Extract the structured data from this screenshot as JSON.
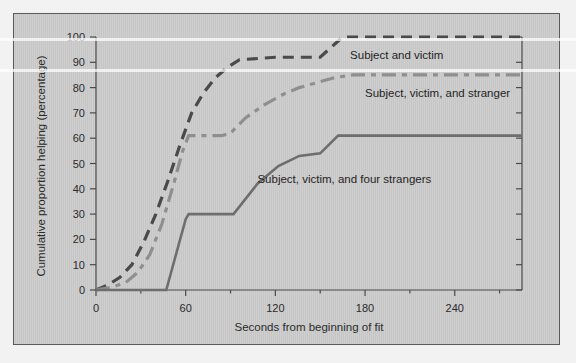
{
  "figure": {
    "background_color": "#f2f2f2",
    "panel_color": "#c9c9c9",
    "panel_border_color": "#5a5a5a"
  },
  "chart_data": {
    "type": "line",
    "title": "",
    "subtitle": "",
    "xlabel": "Seconds from beginning of fit",
    "ylabel": "Cumulative proportion helping (percentage)",
    "xlim": [
      0,
      285
    ],
    "ylim": [
      0,
      100
    ],
    "xticks": [
      0,
      60,
      120,
      180,
      240
    ],
    "xticklabels": [
      "0",
      "60",
      "120",
      "180",
      "240"
    ],
    "xminorticks": [
      30,
      90,
      150,
      210,
      270
    ],
    "yticks": [
      0,
      10,
      20,
      30,
      40,
      50,
      60,
      70,
      80,
      90,
      100
    ],
    "yticklabels": [
      "0",
      "10",
      "20",
      "30",
      "40",
      "50",
      "60",
      "70",
      "80",
      "90",
      "100"
    ],
    "grid": false,
    "legend_position": "inline-annotations",
    "series": [
      {
        "name": "Subject and victim",
        "color": "#4a4a4a",
        "dash": "long-dash",
        "linewidth": 3.2,
        "label_x": 170,
        "label_y": 93,
        "x": [
          0,
          8,
          16,
          24,
          32,
          40,
          48,
          56,
          64,
          72,
          80,
          88,
          96,
          120,
          150,
          165,
          180,
          210,
          240,
          270,
          285
        ],
        "y": [
          0,
          2,
          5,
          10,
          19,
          30,
          43,
          57,
          70,
          78,
          84,
          88,
          91,
          92,
          92,
          100,
          100,
          100,
          100,
          100,
          100
        ]
      },
      {
        "name": "Subject, victim, and stranger",
        "color": "#8f8f8f",
        "dash": "dash-dot",
        "linewidth": 3.2,
        "label_x": 180,
        "label_y": 78,
        "x": [
          0,
          10,
          20,
          28,
          36,
          44,
          52,
          58,
          62,
          72,
          84,
          90,
          100,
          112,
          124,
          136,
          148,
          160,
          172,
          180,
          210,
          240,
          270,
          285
        ],
        "y": [
          0,
          1,
          3,
          7,
          14,
          26,
          42,
          55,
          61,
          61,
          61,
          62,
          68,
          73,
          77,
          80,
          82,
          84,
          85,
          85,
          85,
          85,
          85,
          85
        ]
      },
      {
        "name": "Subject, victim, and four strangers",
        "color": "#6e6e6e",
        "dash": "solid",
        "linewidth": 2.6,
        "label_x": 108,
        "label_y": 44,
        "x": [
          0,
          47,
          47,
          60,
          62,
          92,
          108,
          122,
          136,
          150,
          162,
          180,
          210,
          240,
          270,
          285
        ],
        "y": [
          0,
          0,
          0,
          28,
          30,
          30,
          42,
          49,
          53,
          54,
          61,
          61,
          61,
          61,
          61,
          61
        ]
      }
    ]
  }
}
